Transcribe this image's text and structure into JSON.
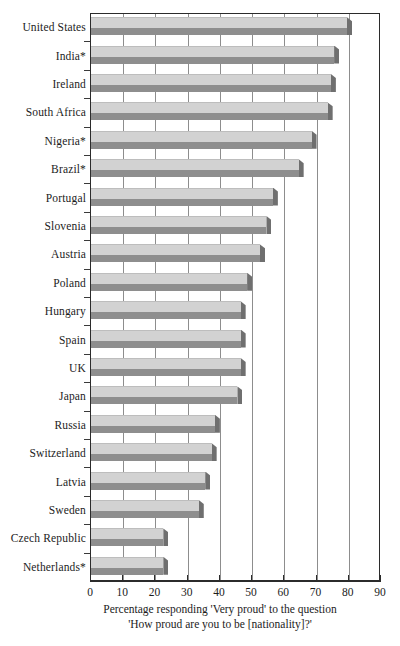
{
  "chart_data": {
    "type": "bar",
    "orientation": "horizontal",
    "title": "",
    "xlabel": "Percentage responding 'Very proud' to the question 'How proud are you to be [nationality]?'",
    "ylabel": "",
    "xlim": [
      0,
      90
    ],
    "grid": true,
    "legend": false,
    "categories": [
      "United States",
      "India*",
      "Ireland",
      "South Africa",
      "Nigeria*",
      "Brazil*",
      "Portugal",
      "Slovenia",
      "Austria",
      "Poland",
      "Hungary",
      "Spain",
      "UK",
      "Japan",
      "Russia",
      "Switzerland",
      "Latvia",
      "Sweden",
      "Czech Republic",
      "Netherlands*"
    ],
    "values": [
      81,
      77,
      76,
      75,
      70,
      66,
      58,
      56,
      54,
      50,
      48,
      48,
      48,
      47,
      40,
      39,
      37,
      35,
      24,
      24
    ],
    "xticks": [
      0,
      10,
      20,
      30,
      40,
      50,
      60,
      70,
      80,
      90
    ],
    "xtick_labels": [
      "0",
      "10",
      "20",
      "30",
      "40",
      "50",
      "60",
      "70",
      "80",
      "90"
    ],
    "colors": {
      "bar_top": "#d2d2d2",
      "bar_front": "#8e8e8e",
      "bar_side": "#6f6f6f",
      "gridline": "#8d8d8d",
      "axis": "#2b2b2b"
    }
  },
  "caption": {
    "line1": "Percentage responding 'Very proud' to the question",
    "line2": "'How proud are you to be [nationality]?'"
  }
}
